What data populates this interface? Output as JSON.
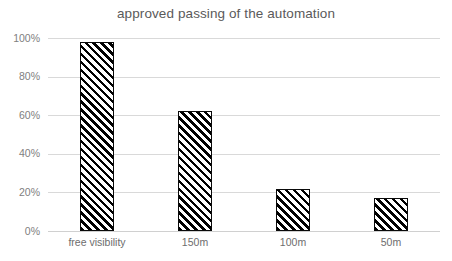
{
  "chart_data": {
    "type": "bar",
    "title": "approved passing of the automation",
    "xlabel": "",
    "ylabel": "",
    "categories": [
      "free visibility",
      "150m",
      "100m",
      "50m"
    ],
    "values": [
      98,
      62,
      22,
      17
    ],
    "ylim": [
      0,
      100
    ],
    "yticks": [
      0,
      20,
      40,
      60,
      80,
      100
    ],
    "ytick_labels": [
      "0%",
      "20%",
      "40%",
      "60%",
      "80%",
      "100%"
    ],
    "grid": true,
    "legend": "none",
    "bar_fill": "diagonal-hatch-black-on-white",
    "colors": {
      "background": "#ffffff",
      "title_text": "#5a5a5a",
      "tick_text": "#808080",
      "category_text": "#6d6d6d",
      "gridline": "#d9d9d9",
      "bar_outline": "#0a0a0a",
      "bar_hatch": "#000000"
    }
  }
}
